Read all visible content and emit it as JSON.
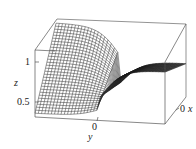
{
  "chart_data": {
    "type": "surface3d",
    "title": "",
    "xlabel": "x",
    "ylabel": "y",
    "zlabel": "z",
    "z_ticks": [
      0.5,
      1
    ],
    "x_ticks": [
      0
    ],
    "y_ticks": [
      0
    ],
    "zlim": [
      0.3,
      1.2
    ],
    "grid": false,
    "style": "black wireframe mesh inside bounding box"
  },
  "labels": {
    "z_axis": "z",
    "z_tick_1": "1",
    "z_tick_05": "0.5",
    "y_axis": "y",
    "y_tick_0": "0",
    "x_axis": "x",
    "x_tick_0": "0"
  },
  "colors": {
    "mesh": "#1a1a1a",
    "box": "#555555",
    "background": "#ffffff"
  }
}
